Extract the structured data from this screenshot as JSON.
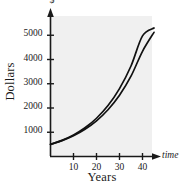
{
  "chart_data": {
    "type": "line",
    "title": "",
    "xlabel": "Years",
    "ylabel": "Dollars",
    "x_axis_arrow_label": "time",
    "y_axis_arrow_label": "$",
    "x_tick_labels": [
      "10",
      "20",
      "30",
      "40"
    ],
    "x_tick_values": [
      10,
      20,
      30,
      40
    ],
    "y_tick_labels": [
      "1000",
      "2000",
      "3000",
      "4000",
      "5000"
    ],
    "y_tick_values": [
      1000,
      2000,
      3000,
      4000,
      5000
    ],
    "xlim": [
      0,
      46
    ],
    "ylim": [
      0,
      5500
    ],
    "grid": false,
    "legend": "none",
    "plot_background_color": "#f0f0f0",
    "line_color": "#111111",
    "x": [
      0,
      5,
      10,
      15,
      20,
      25,
      30,
      35,
      40,
      45
    ],
    "series": [
      {
        "name": "curve-upper",
        "values": [
          500,
          666,
          888,
          1183,
          1577,
          2101,
          2800,
          3731,
          4972,
          5300
        ]
      },
      {
        "name": "curve-lower",
        "values": [
          500,
          655,
          858,
          1124,
          1473,
          1930,
          2528,
          3312,
          4339,
          5120
        ]
      }
    ]
  }
}
